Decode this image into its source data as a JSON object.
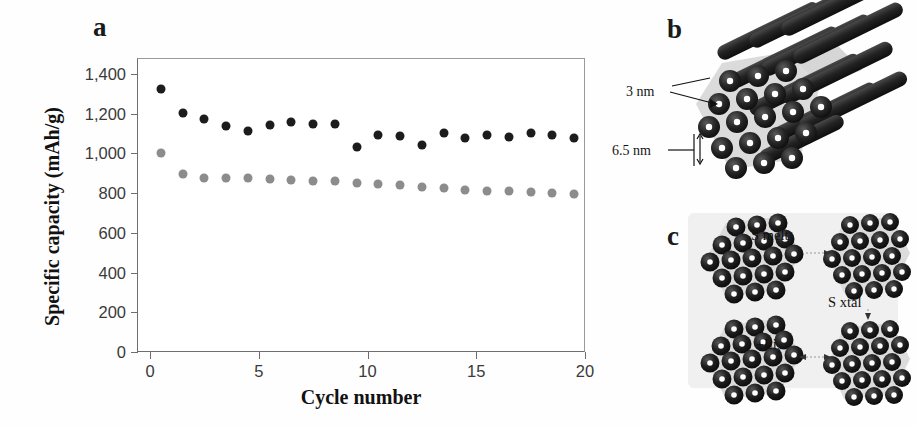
{
  "figure": {
    "width": 917,
    "height": 426,
    "background": "#ffffff"
  },
  "panels": {
    "a": {
      "letter": "a"
    },
    "b": {
      "letter": "b"
    },
    "c": {
      "letter": "c"
    }
  },
  "chart_data": {
    "type": "scatter",
    "title": "",
    "xlabel": "Cycle number",
    "ylabel": "Specific capacity (mAh/g)",
    "xlim": [
      -0.6,
      20
    ],
    "ylim": [
      0,
      1480
    ],
    "xticks": [
      0,
      5,
      10,
      15,
      20
    ],
    "xtick_labels": [
      "0",
      "5",
      "10",
      "15",
      "20"
    ],
    "yticks": [
      0,
      200,
      400,
      600,
      800,
      1000,
      1200,
      1400
    ],
    "ytick_labels": [
      "0",
      "200",
      "400",
      "600",
      "800",
      "1,000",
      "1,200",
      "1,400"
    ],
    "grid": false,
    "legend": "none",
    "marker": "circle",
    "series": [
      {
        "name": "discharge-capacity",
        "color": "#1c1c1c",
        "x": [
          0.5,
          1.5,
          2.5,
          3.5,
          4.5,
          5.5,
          6.5,
          7.5,
          8.5,
          9.5,
          10.5,
          11.5,
          12.5,
          13.5,
          14.5,
          15.5,
          16.5,
          17.5,
          18.5,
          19.5
        ],
        "y": [
          1325,
          1205,
          1175,
          1140,
          1115,
          1145,
          1160,
          1150,
          1150,
          1030,
          1090,
          1085,
          1040,
          1100,
          1075,
          1090,
          1080,
          1100,
          1090,
          1075
        ]
      },
      {
        "name": "charge-capacity",
        "color": "#8c8c8c",
        "x": [
          0.5,
          1.5,
          2.5,
          3.5,
          4.5,
          5.5,
          6.5,
          7.5,
          8.5,
          9.5,
          10.5,
          11.5,
          12.5,
          13.5,
          14.5,
          15.5,
          16.5,
          17.5,
          18.5,
          19.5
        ],
        "y": [
          1000,
          898,
          875,
          877,
          874,
          869,
          868,
          862,
          862,
          849,
          845,
          840,
          830,
          825,
          818,
          812,
          808,
          805,
          800,
          793
        ]
      }
    ]
  },
  "panel_b": {
    "dimension_pore": "3 nm",
    "dimension_spacing": "6.5 nm"
  },
  "panel_c": {
    "label_s_melt": "S melt",
    "label_s_xtal": "S xtal",
    "label_li": "±Li",
    "label_li_sub": "x"
  },
  "colors": {
    "dark_series": "#1c1c1c",
    "gray_series": "#8c8c8c",
    "axis": "#6e6e6e",
    "text": "#1a1a1a",
    "rod": "#2a2a2a",
    "matrix": "#d7d7d7"
  }
}
